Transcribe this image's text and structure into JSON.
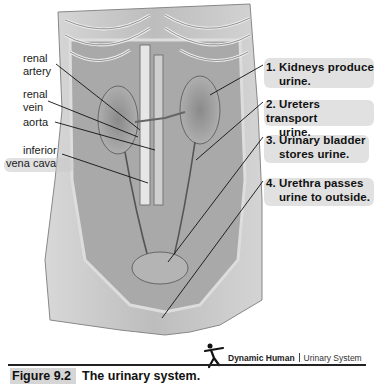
{
  "figure": {
    "left_labels": [
      {
        "id": "renal-artery",
        "lines": [
          "renal",
          "artery"
        ]
      },
      {
        "id": "renal-vein",
        "lines": [
          "renal",
          "vein"
        ]
      },
      {
        "id": "aorta",
        "lines": [
          "aorta"
        ]
      },
      {
        "id": "inferior-vena-cava",
        "lines": [
          "inferior",
          "vena cava"
        ]
      }
    ],
    "right_labels": [
      {
        "number": "1.",
        "line1": "Kidneys produce",
        "line2": "urine."
      },
      {
        "number": "2.",
        "line1": "Ureters transport",
        "line2": "urine."
      },
      {
        "number": "3.",
        "line1": "Urinary bladder",
        "line2": "stores urine."
      },
      {
        "number": "4.",
        "line1": "Urethra passes",
        "line2": "urine to outside."
      }
    ],
    "brand": {
      "name": "Dynamic Human",
      "section": "Urinary System",
      "icon": "dancing-figure-icon"
    },
    "caption": {
      "number": "Figure 9.2",
      "title": "The urinary system."
    },
    "colors": {
      "background": "#ffffff",
      "text": "#111111",
      "highlight": "#c9c9c9",
      "illustration": "#9a9a9a"
    }
  }
}
